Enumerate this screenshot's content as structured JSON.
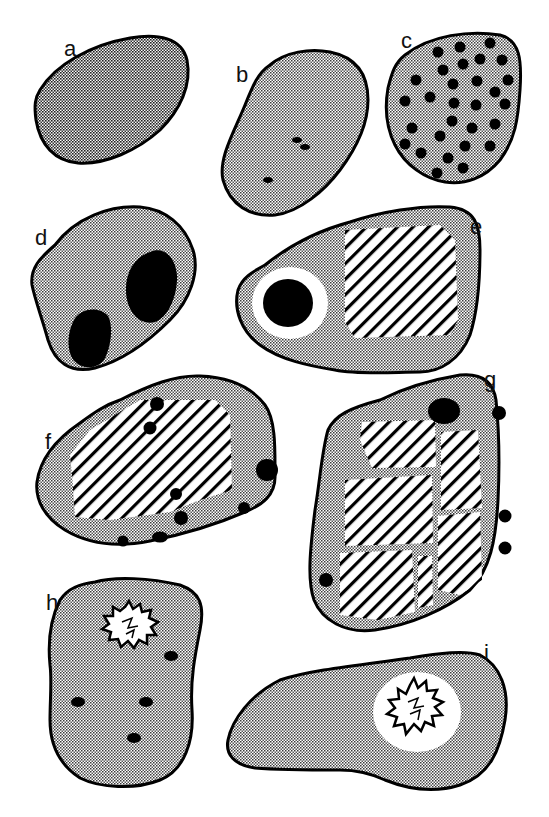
{
  "figure": {
    "type": "grain-schematic",
    "colors": {
      "outline": "#000000",
      "stipple_dot": "#3a3a3a",
      "stipple_bg": "#ffffff",
      "inclusion": "#000000",
      "hatch": "#000000",
      "background": "#ffffff"
    },
    "panels": [
      {
        "id": "a",
        "label": "a",
        "matrix": "dense stipple",
        "features": []
      },
      {
        "id": "b",
        "label": "b",
        "matrix": "stipple",
        "features": [
          "3 small dark inclusions"
        ]
      },
      {
        "id": "c",
        "label": "c",
        "matrix": "stipple",
        "features": [
          "~30 evenly spread dark dots"
        ]
      },
      {
        "id": "d",
        "label": "d",
        "matrix": "stipple",
        "features": [
          "2 large dark inclusions"
        ]
      },
      {
        "id": "e",
        "label": "e",
        "matrix": "stipple",
        "features": [
          "dark inclusion with white rim",
          "hatched block"
        ]
      },
      {
        "id": "f",
        "label": "f",
        "matrix": "stipple",
        "features": [
          "large hatched block",
          "~9 dark inclusions"
        ]
      },
      {
        "id": "g",
        "label": "g",
        "matrix": "stipple",
        "features": [
          "6 hatched blocks separated by stippled veins",
          "5 dark inclusions"
        ]
      },
      {
        "id": "h",
        "label": "h",
        "matrix": "stipple",
        "features": [
          "starburst clast",
          "4 dark dots"
        ]
      },
      {
        "id": "i",
        "label": "i",
        "matrix": "stipple",
        "features": [
          "starburst clast in white halo"
        ]
      }
    ]
  }
}
